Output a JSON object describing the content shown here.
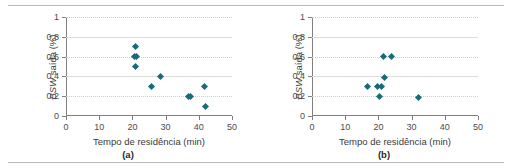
{
  "figure": {
    "panels": [
      {
        "caption": "(a)",
        "chart_data": {
          "type": "scatter",
          "title": "",
          "xlabel": "Tempo de residência (min)",
          "ylabel": "BSW saída (%)",
          "ylabel_italic_part": "BSW",
          "ylabel_rest": " saída (%)",
          "xlim": [
            0,
            50
          ],
          "ylim": [
            0,
            1
          ],
          "xticks": [
            0,
            10,
            20,
            30,
            40,
            50
          ],
          "xticklabels": [
            "0",
            "10",
            "20",
            "30",
            "40",
            "50"
          ],
          "yticks": [
            0,
            0.2,
            0.4,
            0.6,
            0.8,
            1
          ],
          "yticklabels": [
            "0",
            "0,2",
            "0,4",
            "0,6",
            "0,8",
            "1"
          ],
          "grid": true,
          "legend": false,
          "marker_color": "#1a6b79",
          "points": [
            {
              "x": 21.0,
              "y": 0.7
            },
            {
              "x": 20.7,
              "y": 0.6
            },
            {
              "x": 21.3,
              "y": 0.6
            },
            {
              "x": 20.8,
              "y": 0.5
            },
            {
              "x": 28.5,
              "y": 0.4
            },
            {
              "x": 25.8,
              "y": 0.3
            },
            {
              "x": 41.8,
              "y": 0.3
            },
            {
              "x": 36.8,
              "y": 0.2
            },
            {
              "x": 37.6,
              "y": 0.2
            },
            {
              "x": 42.0,
              "y": 0.1
            }
          ]
        }
      },
      {
        "caption": "(b)",
        "chart_data": {
          "type": "scatter",
          "title": "",
          "xlabel": "Tempo de residência (min)",
          "ylabel": "BSW saída (%)",
          "ylabel_italic_part": "BSW",
          "ylabel_rest": " saída (%)",
          "xlim": [
            0,
            50
          ],
          "ylim": [
            0,
            1
          ],
          "xticks": [
            0,
            10,
            20,
            30,
            40,
            50
          ],
          "xticklabels": [
            "0",
            "10",
            "20",
            "30",
            "40",
            "50"
          ],
          "yticks": [
            0,
            0.2,
            0.4,
            0.6,
            0.8,
            1
          ],
          "yticklabels": [
            "0",
            "0,2",
            "0,4",
            "0,6",
            "0,8",
            "1"
          ],
          "grid": true,
          "legend": false,
          "marker_color": "#1a6b79",
          "points": [
            {
              "x": 21.5,
              "y": 0.6
            },
            {
              "x": 23.8,
              "y": 0.6
            },
            {
              "x": 21.8,
              "y": 0.39
            },
            {
              "x": 16.8,
              "y": 0.3
            },
            {
              "x": 19.8,
              "y": 0.3
            },
            {
              "x": 20.8,
              "y": 0.3
            },
            {
              "x": 20.2,
              "y": 0.2
            },
            {
              "x": 32.0,
              "y": 0.19
            }
          ]
        }
      }
    ]
  }
}
